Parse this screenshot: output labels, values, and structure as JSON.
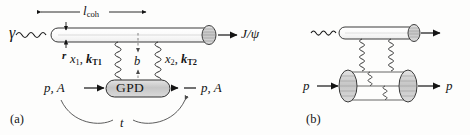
{
  "figure": {
    "type": "feynman-diagram",
    "background_color": "#fdfdfc",
    "ink_color": "#141414",
    "blob_fill": "#cfcfcf",
    "tube_fill": "#ffffff"
  },
  "panel_a": {
    "caption": "(a)",
    "labels": {
      "photon": "γ",
      "coherence_length": "l",
      "coherence_length_sub": "coh",
      "dipole_size": "r",
      "gluon_left_x": "x",
      "gluon_left_x_sub": "1",
      "gluon_left_k": "k",
      "gluon_left_k_sub": "T1",
      "gluon_right_x": "x",
      "gluon_right_x_sub": "2",
      "gluon_right_k": "k",
      "gluon_right_k_sub": "T2",
      "impact_parameter": "b",
      "target_in": "p, A",
      "target_out": "p, A",
      "blob_label": "GPD",
      "final_state": "J/ψ",
      "momentum_transfer": "t",
      "separator": ","
    }
  },
  "panel_b": {
    "caption": "(b)",
    "labels": {
      "proton_in": "p",
      "proton_out": "p"
    }
  }
}
